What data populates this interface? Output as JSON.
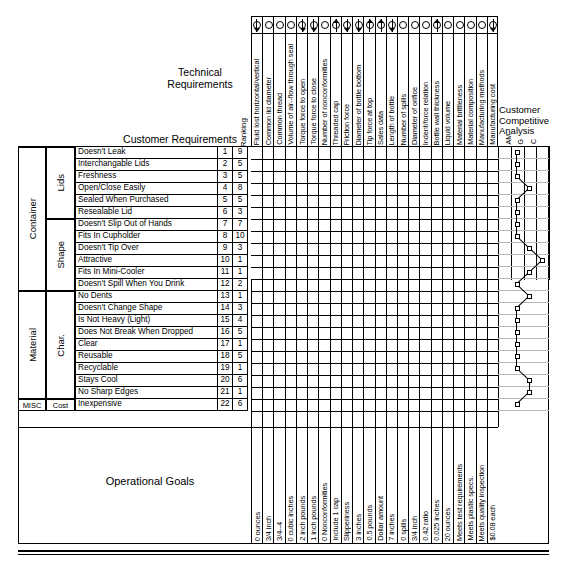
{
  "titles": {
    "technical_requirements": "Technical Requirements",
    "customer_requirements": "Customer Requirements",
    "customer_competitive_analysis": "Customer\nCompetitive\nAnalysis",
    "operational_goals": "Operational Goals",
    "ranking": "Ranking"
  },
  "competitive_legend": [
    "AM",
    "G",
    "C"
  ],
  "categories": [
    {
      "label": "Container",
      "sub": [
        "Lids",
        "Shape"
      ]
    },
    {
      "label": "Material",
      "sub": [
        "Char."
      ]
    },
    {
      "label": "MISC",
      "sub": [
        "Cost"
      ]
    }
  ],
  "customer_requirements": [
    {
      "num": "1",
      "name": "Doesn't Leak",
      "ranking": "9",
      "group": "Lids",
      "parent": "Container",
      "competitive": 2
    },
    {
      "num": "2",
      "name": "Interchangable Lids",
      "ranking": "5",
      "group": "Lids",
      "parent": "Container",
      "competitive": 2
    },
    {
      "num": "3",
      "name": "Freshness",
      "ranking": "5",
      "group": "Lids",
      "parent": "Container",
      "competitive": 2
    },
    {
      "num": "4",
      "name": "Open/Close Easily",
      "ranking": "8",
      "group": "Lids",
      "parent": "Container",
      "competitive": 3
    },
    {
      "num": "5",
      "name": "Sealed When Purchased",
      "ranking": "5",
      "group": "Lids",
      "parent": "Container",
      "competitive": 2
    },
    {
      "num": "6",
      "name": "Resealable Lid",
      "ranking": "3",
      "group": "Lids",
      "parent": "Container",
      "competitive": 2
    },
    {
      "num": "7",
      "name": "Doesn't Slip Out of Hands",
      "ranking": "7",
      "group": "Shape",
      "parent": "Container",
      "competitive": 2
    },
    {
      "num": "8",
      "name": "Fits In Cupholder",
      "ranking": "10",
      "group": "Shape",
      "parent": "Container",
      "competitive": 2
    },
    {
      "num": "9",
      "name": "Doesn't Tip Over",
      "ranking": "3",
      "group": "Shape",
      "parent": "Container",
      "competitive": 3
    },
    {
      "num": "10",
      "name": "Attractive",
      "ranking": "1",
      "group": "Shape",
      "parent": "Container",
      "competitive": 4
    },
    {
      "num": "11",
      "name": "Fits In Mini-Cooler",
      "ranking": "1",
      "group": "Shape",
      "parent": "Container",
      "competitive": 3
    },
    {
      "num": "12",
      "name": "Doesn't Spill When You Drink",
      "ranking": "2",
      "group": "Shape",
      "parent": "Container",
      "competitive": 2
    },
    {
      "num": "13",
      "name": "No Dents",
      "ranking": "1",
      "group": "Char.",
      "parent": "Material",
      "competitive": 3
    },
    {
      "num": "14",
      "name": "Doesn't Change Shape",
      "ranking": "3",
      "group": "Char.",
      "parent": "Material",
      "competitive": 2
    },
    {
      "num": "15",
      "name": "Is Not Heavy (Light)",
      "ranking": "4",
      "group": "Char.",
      "parent": "Material",
      "competitive": 2
    },
    {
      "num": "16",
      "name": "Does Not Break When Dropped",
      "ranking": "5",
      "group": "Char.",
      "parent": "Material",
      "competitive": 2
    },
    {
      "num": "17",
      "name": "Clear",
      "ranking": "1",
      "group": "Char.",
      "parent": "Material",
      "competitive": 2
    },
    {
      "num": "18",
      "name": "Reusable",
      "ranking": "5",
      "group": "Char.",
      "parent": "Material",
      "competitive": 2
    },
    {
      "num": "19",
      "name": "Recyclable",
      "ranking": "1",
      "group": "Char.",
      "parent": "Material",
      "competitive": 2
    },
    {
      "num": "20",
      "name": "Stays Cool",
      "ranking": "6",
      "group": "Char.",
      "parent": "Material",
      "competitive": 3
    },
    {
      "num": "21",
      "name": "No Sharp Edges",
      "ranking": "1",
      "group": "Char.",
      "parent": "Material",
      "competitive": 3
    },
    {
      "num": "22",
      "name": "Inexpensive",
      "ranking": "6",
      "group": "Cost",
      "parent": "MISC",
      "competitive": 2
    }
  ],
  "technical_requirements": [
    {
      "name": "Fluid lost horizontal/vertical",
      "direction": "down",
      "goal": "0 ounces"
    },
    {
      "name": "Common lid diameter",
      "direction": "target",
      "goal": "3/4 inch"
    },
    {
      "name": "Common thread",
      "direction": "target",
      "goal": "3/4--4"
    },
    {
      "name": "Volume of air--flow through seal",
      "direction": "target",
      "goal": "0 cubic inches"
    },
    {
      "name": "Torque force to open",
      "direction": "down",
      "goal": "2 inch pounds"
    },
    {
      "name": "Torque force to close",
      "direction": "down",
      "goal": "1 inch pounds"
    },
    {
      "name": "Number of nonconformities",
      "direction": "target",
      "goal": "0 Nonconformities"
    },
    {
      "name": "Threaded cap",
      "direction": "up",
      "goal": "Include 1 cap"
    },
    {
      "name": "Friction force",
      "direction": "down",
      "goal": "Slipperiness"
    },
    {
      "name": "Diameter of bottle bottom",
      "direction": "down",
      "goal": "3 inches"
    },
    {
      "name": "Tip force at top",
      "direction": "up",
      "goal": "0.5 pounds"
    },
    {
      "name": "Sales data",
      "direction": "up",
      "goal": "Dollar amount"
    },
    {
      "name": "Length of bottle",
      "direction": "down",
      "goal": "7 inches"
    },
    {
      "name": "Number of spills",
      "direction": "target",
      "goal": "0 spills"
    },
    {
      "name": "Diameter of orifice",
      "direction": "target",
      "goal": "3/4 inch"
    },
    {
      "name": "Indent/force relation",
      "direction": "target",
      "goal": "0.42 ratio"
    },
    {
      "name": "Bottle wall thickness",
      "direction": "up",
      "goal": "0.025 inches"
    },
    {
      "name": "Liquid volume",
      "direction": "target",
      "goal": "20 ounces"
    },
    {
      "name": "Material brittleness",
      "direction": "target",
      "goal": "Meets test requirements"
    },
    {
      "name": "Material composition",
      "direction": "target",
      "goal": "Meets plastic specs."
    },
    {
      "name": "Manufacturing methods",
      "direction": "target",
      "goal": "Meets quality inspection"
    },
    {
      "name": "Manufacturing cost",
      "direction": "down",
      "goal": "$0.08 each"
    }
  ],
  "colors": {
    "line": "#000000",
    "background": "#ffffff",
    "grid_light": "#bbbbbb"
  }
}
